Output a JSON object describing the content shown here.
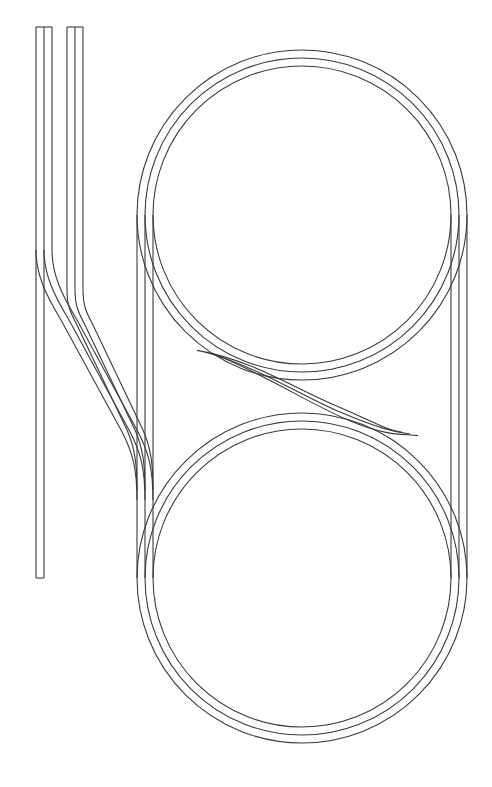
{
  "canvas": {
    "width": 492,
    "height": 787,
    "background": "#ffffff"
  },
  "style": {
    "stroke": "#3a3a3a",
    "stroke_width": 1.1
  },
  "diagram_data": {
    "type": "track-layout",
    "description": "Figure-eight style double loop (two stacked concentric 3-rail circles) joined by straight sides, a diagonal crossover between the loops, and two left-side stub spurs curving into the lower loop.",
    "rail_pitch": 8,
    "loops": [
      {
        "id": "upper-loop",
        "cx": 302,
        "cy": 215,
        "radii": [
          165,
          157,
          149
        ]
      },
      {
        "id": "lower-loop",
        "cx": 302,
        "cy": 578,
        "radii": [
          165,
          157,
          149
        ]
      }
    ],
    "side_straights": {
      "left_x": [
        137,
        145,
        153
      ],
      "right_x": [
        467,
        459,
        451
      ],
      "y_top": 215,
      "y_bottom": 578
    },
    "crossover": {
      "from": {
        "x": 250,
        "y": 365
      },
      "to": {
        "x": 355,
        "y": 428
      }
    },
    "stubs": [
      {
        "id": "stub-left",
        "x": [
          36,
          44,
          52
        ],
        "y_top": 27,
        "y_end": 578,
        "closed_ends": true
      },
      {
        "id": "stub-right",
        "x": [
          67,
          75,
          83
        ],
        "y_top": 27,
        "y_branch": 290
      }
    ]
  }
}
